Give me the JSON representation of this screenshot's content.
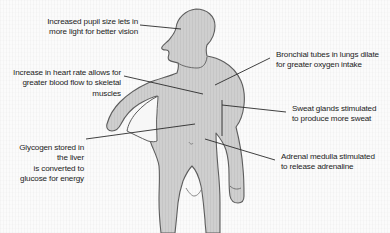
{
  "diagram": {
    "colors": {
      "background": "#fbfbfb",
      "body_fill": "#cfcfcf",
      "body_outline": "#5d5d5d",
      "leader_line": "#2b2b2b",
      "text": "#1b1b1b"
    },
    "callouts": [
      {
        "id": "pupil",
        "name": "callout-pupil",
        "text": "Increased pupil size lets in\nmore light for better vision",
        "align": "right",
        "target": "eye"
      },
      {
        "id": "heart-rate",
        "name": "callout-heart-rate",
        "text": "Increase in heart rate allows for\ngreater blood flow to skeletal muscles",
        "align": "right",
        "target": "chest"
      },
      {
        "id": "glycogen",
        "name": "callout-glycogen",
        "text": "Glycogen stored in the liver\nis converted to glucose for energy",
        "align": "right",
        "target": "liver"
      },
      {
        "id": "bronchial",
        "name": "callout-bronchial-tubes",
        "text": "Bronchial tubes in lungs dilate\nfor greater oxygen intake",
        "align": "left",
        "target": "lungs"
      },
      {
        "id": "sweat",
        "name": "callout-sweat-glands",
        "text": "Sweat glands stimulated\nto produce more sweat",
        "align": "left",
        "target": "skin-arm"
      },
      {
        "id": "adrenal",
        "name": "callout-adrenal-medulla",
        "text": "Adrenal medulla stimulated\nto release adrenaline",
        "align": "left",
        "target": "adrenal-gland"
      }
    ]
  }
}
